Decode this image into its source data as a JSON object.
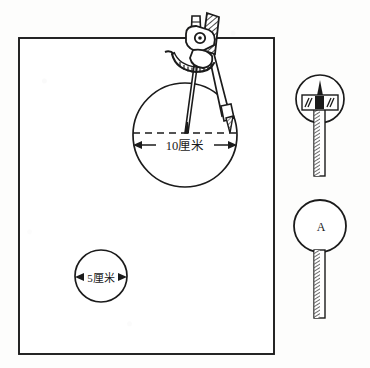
{
  "figure": {
    "ink_color": "#1b1b1b",
    "paper_color": "#fdfdfc"
  },
  "sheet": {
    "name": "drawing-sheet",
    "x": 19,
    "y": 38,
    "width": 255,
    "height": 316
  },
  "large_circle": {
    "name": "large-circle",
    "cx": 185,
    "cy": 135,
    "r": 52,
    "dimension_label": "10厘米",
    "dimension_value": 10,
    "dimension_unit": "厘米"
  },
  "small_circle": {
    "name": "small-circle",
    "cx": 101,
    "cy": 276,
    "r": 26,
    "dimension_label": "5厘米",
    "dimension_value": 5,
    "dimension_unit": "厘米"
  },
  "compass": {
    "name": "drawing-compass",
    "pivot_x": 203,
    "pivot_y": 42,
    "needle_tip_x": 186,
    "needle_tip_y": 133
  },
  "detail_top": {
    "name": "lead-tip-detail",
    "cx": 320,
    "cy": 99,
    "r": 24,
    "plate_label": ""
  },
  "detail_bottom": {
    "name": "point-detail",
    "cx": 320,
    "cy": 226,
    "r": 26,
    "label": "A"
  }
}
